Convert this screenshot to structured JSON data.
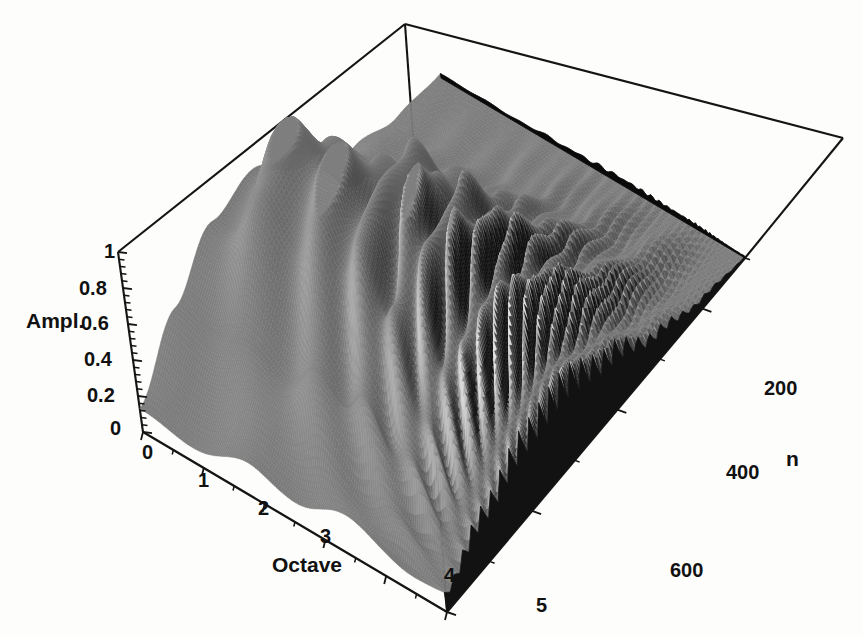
{
  "figure": {
    "kind": "3d-surface-plot",
    "background_color": "#fdfdfb",
    "line_color": "#111111",
    "width": 863,
    "height": 637
  },
  "axes": {
    "vertical": {
      "name": "amplitude-axis",
      "label": "Ampl.",
      "ticks": [
        "1",
        "0.8",
        "0.6",
        "0.4",
        "0.2",
        "0"
      ],
      "tick_values": [
        1,
        0.8,
        0.6,
        0.4,
        0.2,
        0
      ],
      "range": [
        0,
        1
      ],
      "minor_ticks": 25
    },
    "depth_left": {
      "name": "octave-axis",
      "label": "Octave",
      "ticks": [
        "0",
        "1",
        "2",
        "3",
        "4",
        "5"
      ],
      "tick_values": [
        0,
        1,
        2,
        3,
        4,
        5
      ],
      "range": [
        0,
        5
      ]
    },
    "depth_right": {
      "name": "n-axis",
      "label": "n",
      "ticks": [
        "200",
        "400",
        "600"
      ],
      "tick_values": [
        200,
        400,
        600
      ],
      "range": [
        0,
        700
      ]
    }
  },
  "chart_data": {
    "type": "surface",
    "title": "",
    "xlabel": "Octave",
    "ylabel": "n",
    "zlabel": "Ampl.",
    "xlim": [
      0,
      5
    ],
    "ylim": [
      0,
      700
    ],
    "zlim": [
      0,
      1
    ],
    "x": [
      0,
      1,
      2,
      3,
      4,
      5
    ],
    "y": [
      0,
      100,
      200,
      300,
      400,
      500,
      600,
      700
    ],
    "grid": false,
    "legend": "none",
    "colormap": "grayscale-dither",
    "z": [
      [
        0.1,
        0.34,
        0.62,
        0.81,
        0.55,
        0.2,
        0.06,
        0.02
      ],
      [
        0.12,
        0.41,
        0.72,
        0.93,
        0.64,
        0.25,
        0.08,
        0.02
      ],
      [
        0.15,
        0.48,
        0.8,
        0.97,
        0.7,
        0.31,
        0.1,
        0.03
      ],
      [
        0.18,
        0.52,
        0.76,
        0.88,
        0.66,
        0.35,
        0.13,
        0.04
      ],
      [
        0.16,
        0.45,
        0.63,
        0.7,
        0.52,
        0.28,
        0.11,
        0.03
      ],
      [
        0.09,
        0.26,
        0.38,
        0.42,
        0.3,
        0.14,
        0.05,
        0.01
      ]
    ],
    "surface_params": {
      "ripple_amplitude": 0.3,
      "ridge_center_octave": 2.2,
      "ridge_center_n": 250,
      "peak_amplitude": 0.97
    }
  },
  "geometry": {
    "box_top_apex": {
      "x": 405,
      "y": 24
    },
    "box_left_top": {
      "x": 118,
      "y": 252
    },
    "box_right_top": {
      "x": 843,
      "y": 138
    },
    "box_origin": {
      "x": 143,
      "y": 432
    },
    "box_front": {
      "x": 447,
      "y": 612
    },
    "box_right_low": {
      "x": 745,
      "y": 258
    }
  },
  "labels": {
    "ampl_label": {
      "text": "Ampl.",
      "x": 26,
      "y": 309
    },
    "octave_label": {
      "text": "Octave",
      "x": 272,
      "y": 553
    },
    "n_label": {
      "text": "n",
      "x": 786,
      "y": 447
    },
    "ampl_ticks": [
      {
        "text": "1",
        "x": 104,
        "y": 240
      },
      {
        "text": "0.8",
        "x": 79,
        "y": 277
      },
      {
        "text": "0.6",
        "x": 81,
        "y": 312
      },
      {
        "text": "0.4",
        "x": 84,
        "y": 348
      },
      {
        "text": "0.2",
        "x": 87,
        "y": 384
      },
      {
        "text": "0",
        "x": 110,
        "y": 417
      }
    ],
    "octave_ticks": [
      {
        "text": "0",
        "x": 142,
        "y": 441
      },
      {
        "text": "1",
        "x": 198,
        "y": 469
      },
      {
        "text": "2",
        "x": 258,
        "y": 497
      },
      {
        "text": "3",
        "x": 320,
        "y": 525
      },
      {
        "text": "4",
        "x": 444,
        "y": 564
      },
      {
        "text": "5",
        "x": 536,
        "y": 594
      }
    ],
    "n_ticks": [
      {
        "text": "200",
        "x": 764,
        "y": 377
      },
      {
        "text": "400",
        "x": 726,
        "y": 461
      },
      {
        "text": "600",
        "x": 670,
        "y": 559
      }
    ]
  }
}
